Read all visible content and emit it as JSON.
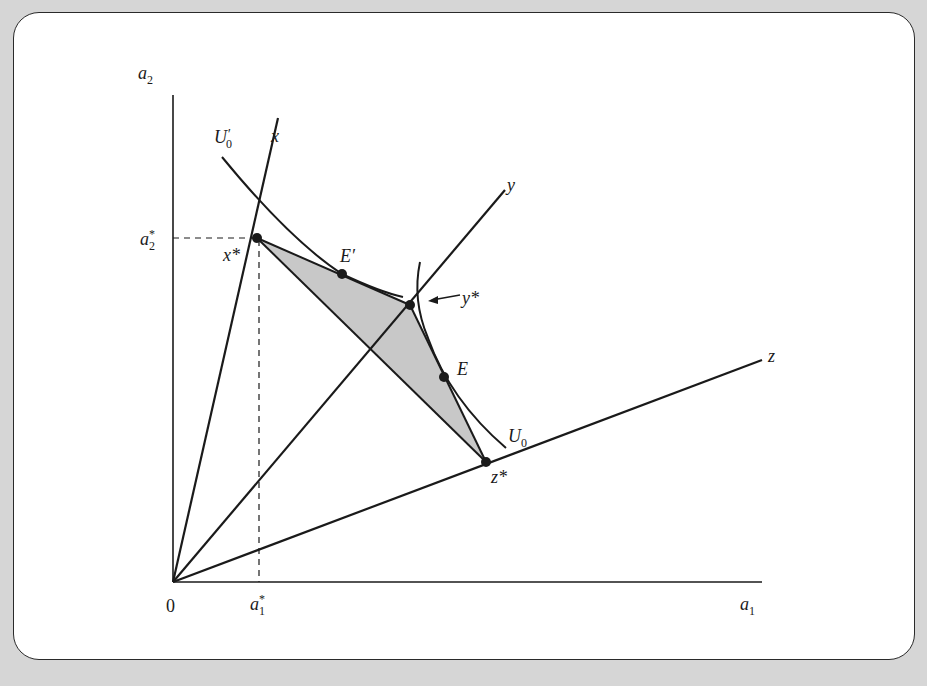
{
  "figure": {
    "axes": {
      "y_label": "a",
      "y_label_sub": "2",
      "x_label": "a",
      "x_label_sub": "1",
      "origin_label": "0",
      "a2_star": "a",
      "a2_star_sub": "2",
      "a2_star_sup": "*",
      "a1_star": "a",
      "a1_star_sub": "1",
      "a1_star_sup": "*"
    },
    "rays": {
      "x": "x",
      "y": "y",
      "z": "z"
    },
    "points": {
      "x_star": "x*",
      "y_star": "y*",
      "z_star": "z*",
      "E": "E",
      "E_prime": "E′"
    },
    "curves": {
      "U0_prime": "U",
      "U0_prime_sub": "0",
      "U0_prime_mark": "′",
      "U0": "U",
      "U0_sub": "0"
    },
    "colors": {
      "background": "#d6d6d6",
      "panel": "#ffffff",
      "line": "#1a1a1a",
      "shade": "#c8c8c8"
    }
  }
}
